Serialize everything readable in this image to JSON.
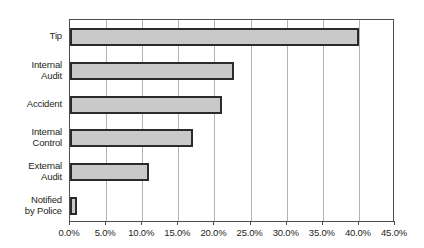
{
  "chart_data": {
    "type": "bar",
    "orientation": "horizontal",
    "title": "",
    "xlabel": "",
    "ylabel": "",
    "categories": [
      "Tip",
      "Internal Audit",
      "Accident",
      "Internal Control",
      "External Audit",
      "Notified by Police"
    ],
    "category_labels_multiline": [
      "Tip",
      "Internal\nAudit",
      "Accident",
      "Internal\nControl",
      "External\nAudit",
      "Notified\nby Police"
    ],
    "values": [
      40.0,
      22.7,
      21.0,
      17.0,
      11.0,
      1.0
    ],
    "value_unit": "%",
    "xlim": [
      0,
      45
    ],
    "xticks": [
      0,
      5,
      10,
      15,
      20,
      25,
      30,
      35,
      40,
      45
    ],
    "xtick_labels": [
      "0.0%",
      "5.0%",
      "10.0%",
      "15.0%",
      "20.0%",
      "25.0%",
      "30.0%",
      "35.0%",
      "40.0%",
      "45.0%"
    ],
    "grid": {
      "vertical": true,
      "horizontal": false
    },
    "legend": {
      "visible": false,
      "position": "none"
    },
    "series": [
      {
        "name": "Initial Detection",
        "values": [
          40.0,
          22.7,
          21.0,
          17.0,
          11.0,
          1.0
        ]
      }
    ]
  },
  "style": {
    "bar_fill": "#c9c9c9",
    "bar_border": "#2b2b2b",
    "gridline_color": "#b3b3b3",
    "axis_border_color": "#4d4d4d",
    "text_color": "#231f20",
    "background": "#ffffff"
  }
}
